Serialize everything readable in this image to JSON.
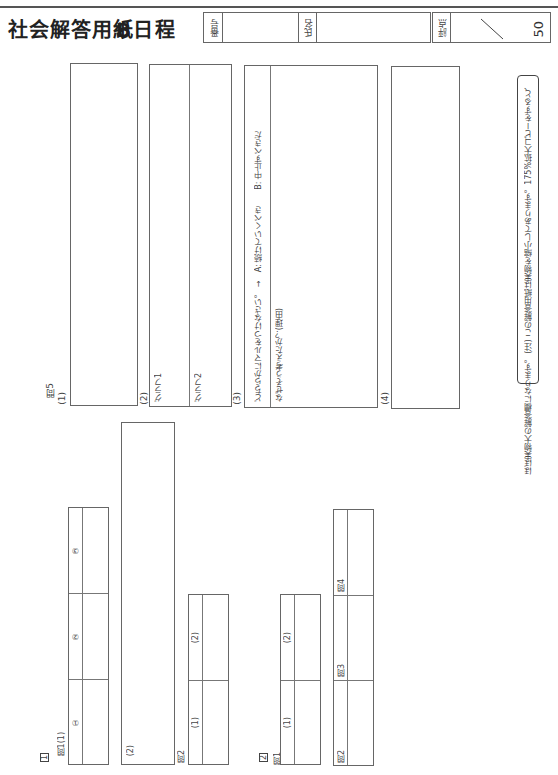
{
  "header": {
    "title": "社会解答用紙",
    "schedule": "B日程",
    "number_label": "番号",
    "number_value": "",
    "name_label": "氏名",
    "name_value": "",
    "score_label": "評点",
    "score_max": "50"
  },
  "section1": {
    "marker": "1",
    "q1_label": "問1(1)",
    "q1_cells": [
      "①",
      "②",
      "③"
    ],
    "q1_2_label": "(2)",
    "q2_label": "問2",
    "q2_cells": [
      "(1)",
      "(2)"
    ]
  },
  "section2": {
    "marker": "2",
    "q1_label": "問1",
    "q1_cells": [
      "(1)",
      "(2)"
    ],
    "q234_cells": [
      "問2",
      "問3",
      "問4"
    ]
  },
  "question5": {
    "label": "問5",
    "part1_label": "(1)",
    "part2_label": "(2)",
    "graph1_label": "グラフ1",
    "graph2_label": "グラフ2",
    "part3_label": "(3)",
    "choice_prompt": "どちらかにマルをつけなさい。 →　A: 続けていくべき　　B: 中止すべきだ",
    "reason_prompt": "なぜそう考えたか？(理由)",
    "part4_label": "(4)"
  },
  "note": {
    "line1": "(注) この解答用紙は実物を縮小してあります。175%拡大コピーをすると、",
    "line2": "ほぼ実物大の解答欄になります。"
  }
}
